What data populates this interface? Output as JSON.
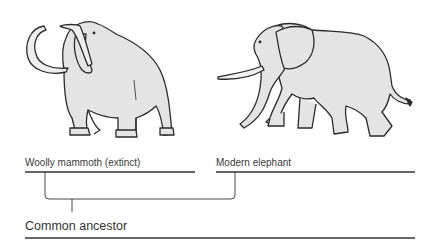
{
  "diagram": {
    "type": "phylogeny",
    "taxa": [
      {
        "id": "mammoth",
        "label": "Woolly mammoth (extinct)",
        "icon": "woolly-mammoth-icon"
      },
      {
        "id": "elephant",
        "label": "Modern elephant",
        "icon": "elephant-icon"
      }
    ],
    "ancestor": {
      "label": "Common ancestor"
    },
    "colors": {
      "line": "#333333",
      "fill": "#e6e6e6",
      "stroke": "#2a2a2a"
    }
  }
}
